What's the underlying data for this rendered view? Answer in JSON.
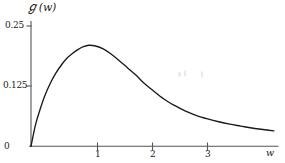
{
  "chart_data": {
    "type": "line",
    "title": "",
    "subtitle": "",
    "xlabel": "w",
    "ylabel": "ℊ(w)",
    "ylabel_symbol": "ℊ",
    "ylabel_argument": "(w)",
    "xlim": [
      0,
      4.6
    ],
    "ylim": [
      0,
      0.2708
    ],
    "grid": false,
    "legend": null,
    "legend_position": "none",
    "xticks": [
      0,
      1,
      2,
      3
    ],
    "xtick_labels": [
      "0",
      "1",
      "2",
      "3"
    ],
    "yticks": [
      0,
      0.125,
      0.25
    ],
    "ytick_labels": [
      "0",
      "0.125",
      "0.25"
    ],
    "line_color": "#1a1a1a",
    "background_color": "#ffffff",
    "axis_color": "#4a4a4a",
    "series": [
      {
        "name": "G(w)",
        "x": [
          0,
          0.08,
          0.16,
          0.25,
          0.35,
          0.45,
          0.55,
          0.65,
          0.75,
          0.85,
          0.95,
          1.05,
          1.15,
          1.3,
          1.45,
          1.6,
          1.75,
          1.9,
          2.05,
          2.2,
          2.4,
          2.6,
          2.8,
          3.0,
          3.2,
          3.4,
          3.6,
          3.8,
          4.0,
          4.2,
          4.4
        ],
        "y": [
          0,
          0.044,
          0.075,
          0.105,
          0.131,
          0.152,
          0.169,
          0.183,
          0.193,
          0.201,
          0.207,
          0.21,
          0.209,
          0.203,
          0.192,
          0.178,
          0.163,
          0.148,
          0.131,
          0.117,
          0.099,
          0.085,
          0.073,
          0.064,
          0.057,
          0.051,
          0.046,
          0.042,
          0.038,
          0.035,
          0.032
        ]
      }
    ],
    "peak": {
      "x": 1.05,
      "y": 0.21
    },
    "annotations": []
  },
  "figure": {
    "axis_origin_label": "0",
    "y_axis_name": "y-axis",
    "x_axis_name": "x-axis"
  }
}
